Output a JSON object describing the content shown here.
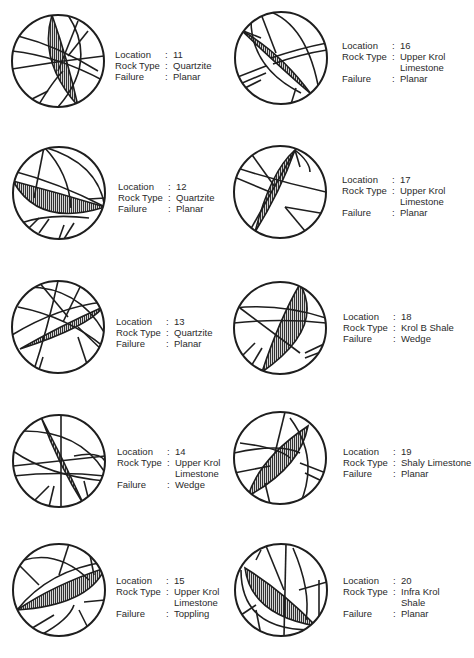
{
  "figure": {
    "labels": {
      "location": "Location",
      "rock_type": "Rock Type",
      "failure": "Failure",
      "separator": ":"
    },
    "panels": [
      {
        "location": "11",
        "rock_type": [
          "Quartzite"
        ],
        "failure": "Planar"
      },
      {
        "location": "12",
        "rock_type": [
          "Quartzite"
        ],
        "failure": "Planar"
      },
      {
        "location": "13",
        "rock_type": [
          "Quartzite"
        ],
        "failure": "Planar"
      },
      {
        "location": "14",
        "rock_type": [
          "Upper Krol",
          "Limestone"
        ],
        "failure": "Wedge"
      },
      {
        "location": "15",
        "rock_type": [
          "Upper Krol",
          "Limestone"
        ],
        "failure": "Toppling"
      },
      {
        "location": "16",
        "rock_type": [
          "Upper Krol",
          "Limestone"
        ],
        "failure": "Planar"
      },
      {
        "location": "17",
        "rock_type": [
          "Upper Krol",
          "Limestone"
        ],
        "failure": "Planar"
      },
      {
        "location": "18",
        "rock_type": [
          "Krol B Shale"
        ],
        "failure": "Wedge"
      },
      {
        "location": "19",
        "rock_type": [
          "Shaly Limestone"
        ],
        "failure": "Planar"
      },
      {
        "location": "20",
        "rock_type": [
          "Infra Krol",
          "Shale"
        ],
        "failure": "Planar"
      }
    ],
    "colors": {
      "ink": "#1e1e1e",
      "hatch": "#3a3a3a",
      "text": "#2a2a2a"
    }
  }
}
